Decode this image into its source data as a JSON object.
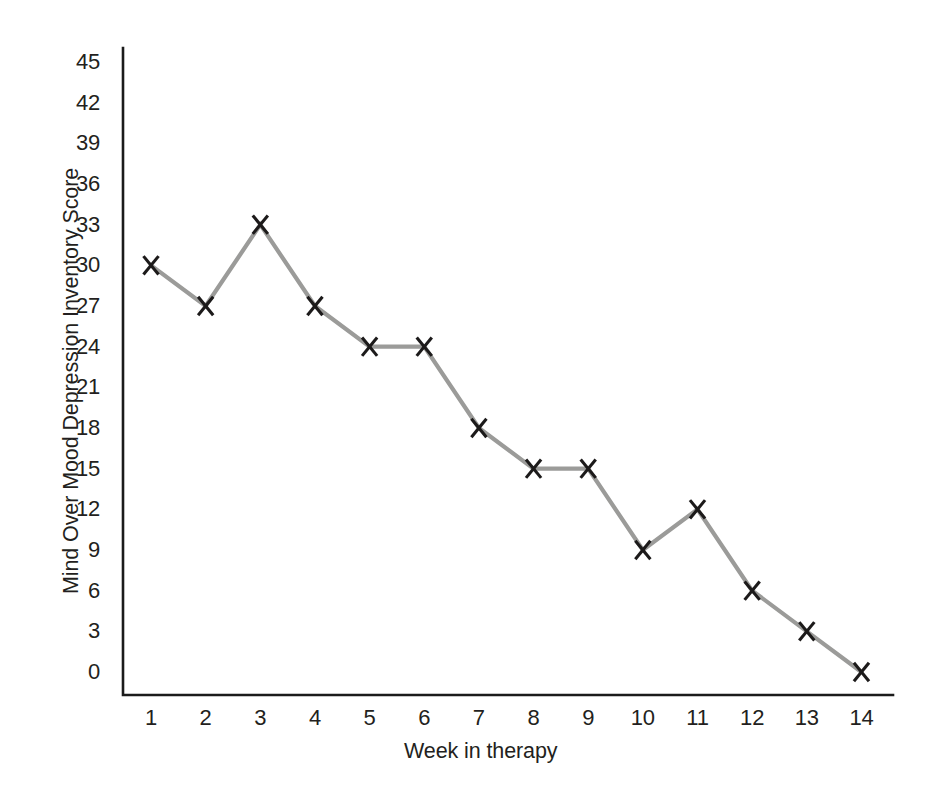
{
  "chart_data": {
    "type": "line",
    "title": "",
    "subtitle": "",
    "xlabel": "Week in therapy",
    "ylabel": "Mind Over Mood Depression Inventory Score",
    "x": [
      1,
      2,
      3,
      4,
      5,
      6,
      7,
      8,
      9,
      10,
      11,
      12,
      13,
      14
    ],
    "categories": [
      "1",
      "2",
      "3",
      "4",
      "5",
      "6",
      "7",
      "8",
      "9",
      "10",
      "11",
      "12",
      "13",
      "14"
    ],
    "values": [
      30,
      27,
      33,
      27,
      24,
      24,
      18,
      15,
      15,
      9,
      12,
      6,
      3,
      0
    ],
    "series": [
      {
        "name": "Mind Over Mood Depression Inventory Score",
        "values": [
          30,
          27,
          33,
          27,
          24,
          24,
          18,
          15,
          15,
          9,
          12,
          6,
          3,
          0
        ]
      }
    ],
    "xlim": [
      1,
      14
    ],
    "ylim": [
      0,
      45
    ],
    "ytick_labels": [
      "45",
      "42",
      "39",
      "36",
      "33",
      "30",
      "27",
      "24",
      "21",
      "18",
      "15",
      "12",
      "9",
      "6",
      "3",
      "0"
    ],
    "ytick_values": [
      45,
      42,
      39,
      36,
      33,
      30,
      27,
      24,
      21,
      18,
      15,
      12,
      9,
      6,
      3,
      0
    ],
    "ytick_step": 3,
    "xtick_labels": [
      "1",
      "2",
      "3",
      "4",
      "5",
      "6",
      "7",
      "8",
      "9",
      "10",
      "11",
      "12",
      "13",
      "14"
    ],
    "grid": false,
    "ticks_shown": false,
    "legend": "none",
    "marker": "x",
    "colors": {
      "line": "#9b9b99",
      "marker": "#1c1a1a",
      "axis": "#1b1b1b",
      "text": "#231f20",
      "background": "#ffffff"
    },
    "annotations": []
  }
}
